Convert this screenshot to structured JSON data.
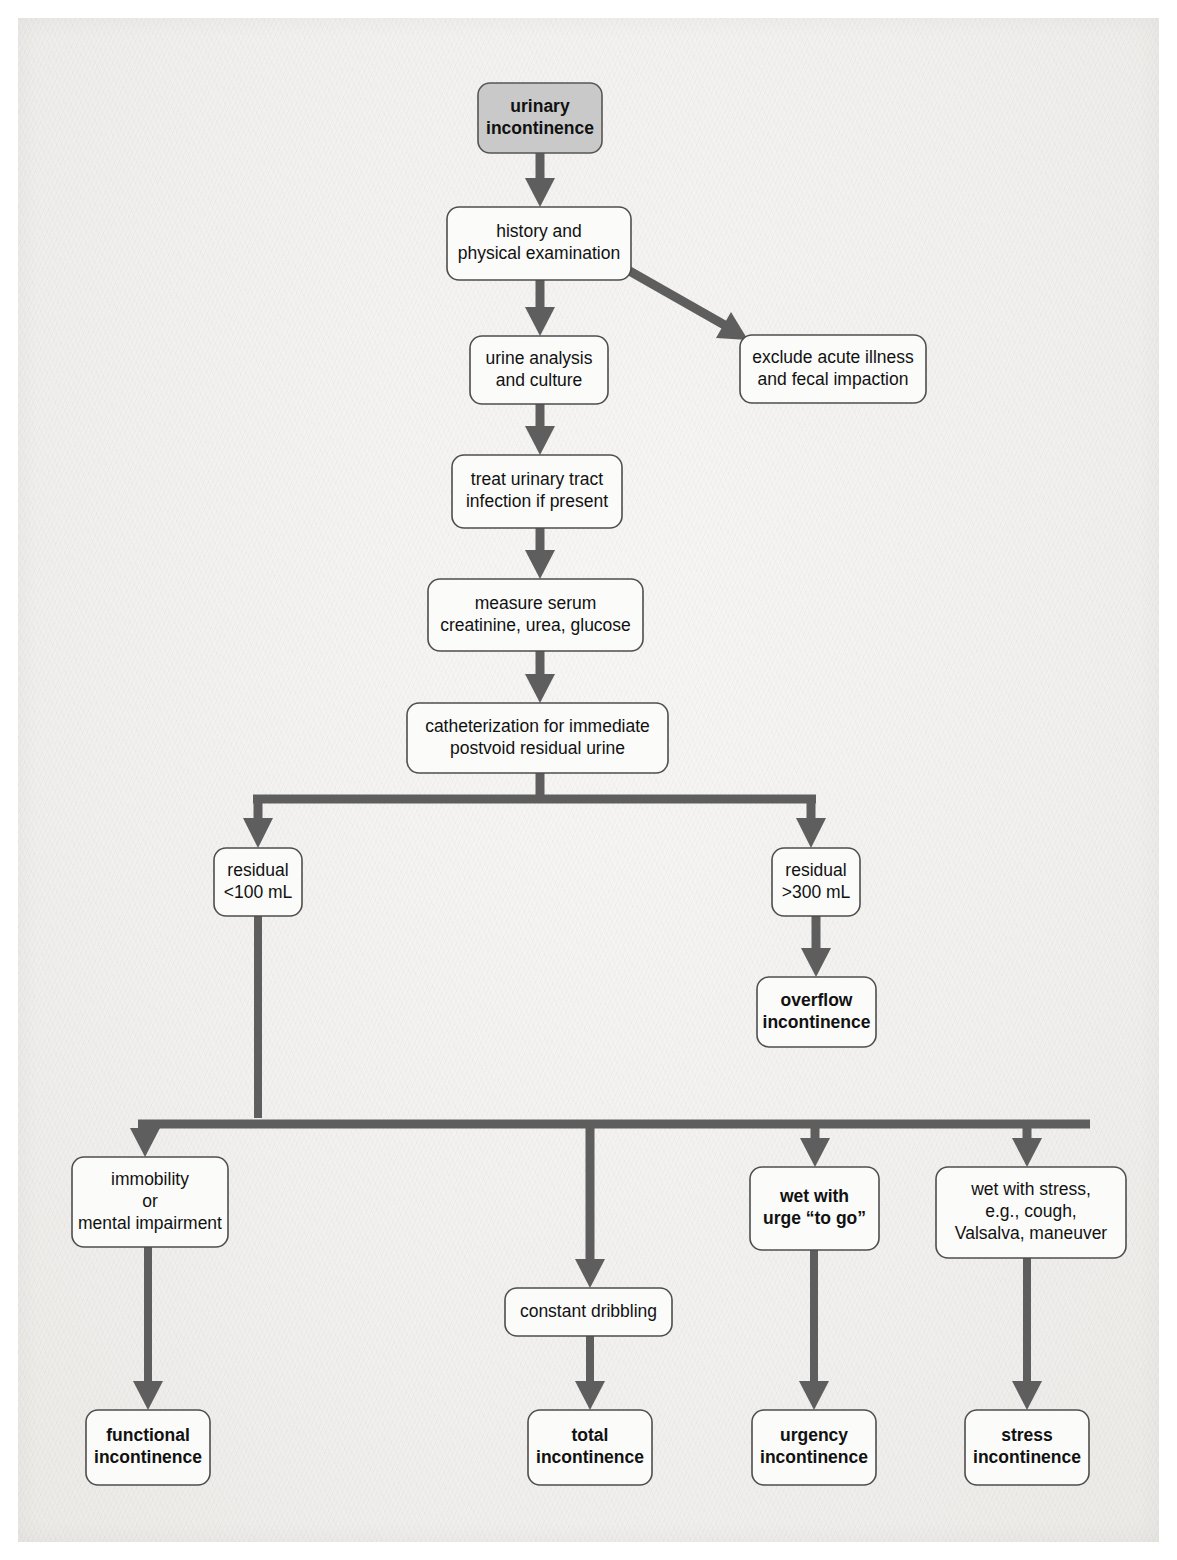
{
  "diagram": {
    "colors": {
      "connector": "#5e5e5e",
      "box_fill": "#fbfbfa",
      "box_stroke": "#4e4e4e",
      "shaded_box_fill": "#c9c9c9",
      "page_background": "#f3f2f0",
      "text": "#111111"
    },
    "nodes": [
      {
        "id": "urinary-incontinence",
        "lines": [
          "urinary",
          "incontinence"
        ],
        "bold": true,
        "shaded": true,
        "x": 478,
        "y": 83,
        "w": 124,
        "h": 70
      },
      {
        "id": "history-and-physical",
        "lines": [
          "history and",
          "physical examination"
        ],
        "bold": false,
        "shaded": false,
        "x": 447,
        "y": 207,
        "w": 184,
        "h": 73
      },
      {
        "id": "exclude-acute-illness",
        "lines": [
          "exclude acute illness",
          "and fecal impaction"
        ],
        "bold": false,
        "shaded": false,
        "x": 740,
        "y": 335,
        "w": 186,
        "h": 68
      },
      {
        "id": "urine-analysis",
        "lines": [
          "urine analysis",
          "and culture"
        ],
        "bold": false,
        "shaded": false,
        "x": 470,
        "y": 336,
        "w": 138,
        "h": 68
      },
      {
        "id": "treat-uti",
        "lines": [
          "treat urinary tract",
          "infection if present"
        ],
        "bold": false,
        "shaded": false,
        "x": 452,
        "y": 455,
        "w": 170,
        "h": 73
      },
      {
        "id": "measure-serum",
        "lines": [
          "measure serum",
          "creatinine, urea, glucose"
        ],
        "bold": false,
        "shaded": false,
        "x": 428,
        "y": 579,
        "w": 215,
        "h": 72
      },
      {
        "id": "catheterization",
        "lines": [
          "catheterization for immediate",
          "postvoid residual urine"
        ],
        "bold": false,
        "shaded": false,
        "x": 407,
        "y": 703,
        "w": 261,
        "h": 70
      },
      {
        "id": "residual-under-100",
        "lines": [
          "residual",
          "<100 mL"
        ],
        "bold": false,
        "shaded": false,
        "x": 214,
        "y": 848,
        "w": 88,
        "h": 68
      },
      {
        "id": "residual-over-300",
        "lines": [
          "residual",
          ">300 mL"
        ],
        "bold": false,
        "shaded": false,
        "x": 772,
        "y": 848,
        "w": 88,
        "h": 68
      },
      {
        "id": "overflow-incontinence",
        "lines": [
          "overflow",
          "incontinence"
        ],
        "bold": true,
        "shaded": false,
        "x": 757,
        "y": 977,
        "w": 119,
        "h": 70
      },
      {
        "id": "immobility-or-mental-impairment",
        "lines": [
          "immobility",
          "or",
          "mental impairment"
        ],
        "bold": false,
        "shaded": false,
        "x": 72,
        "y": 1157,
        "w": 156,
        "h": 90
      },
      {
        "id": "wet-with-urge",
        "lines": [
          "wet with",
          "urge “to go”"
        ],
        "bold": true,
        "shaded": false,
        "x": 750,
        "y": 1167,
        "w": 129,
        "h": 83
      },
      {
        "id": "wet-with-stress",
        "lines": [
          "wet with stress,",
          "e.g., cough,",
          "Valsalva, maneuver"
        ],
        "bold": false,
        "shaded": false,
        "x": 936,
        "y": 1167,
        "w": 190,
        "h": 91
      },
      {
        "id": "constant-dribbling",
        "lines": [
          "constant dribbling"
        ],
        "bold": false,
        "shaded": false,
        "x": 505,
        "y": 1288,
        "w": 167,
        "h": 48
      },
      {
        "id": "functional-incontinence",
        "lines": [
          "functional",
          "incontinence"
        ],
        "bold": true,
        "shaded": false,
        "x": 86,
        "y": 1410,
        "w": 124,
        "h": 75
      },
      {
        "id": "total-incontinence",
        "lines": [
          "total",
          "incontinence"
        ],
        "bold": true,
        "shaded": false,
        "x": 528,
        "y": 1410,
        "w": 124,
        "h": 75
      },
      {
        "id": "urgency-incontinence",
        "lines": [
          "urgency",
          "incontinence"
        ],
        "bold": true,
        "shaded": false,
        "x": 752,
        "y": 1410,
        "w": 124,
        "h": 75
      },
      {
        "id": "stress-incontinence",
        "lines": [
          "stress",
          "incontinence"
        ],
        "bold": true,
        "shaded": false,
        "x": 965,
        "y": 1410,
        "w": 124,
        "h": 75
      }
    ],
    "edges": [
      {
        "id": "ui-to-history",
        "from": "urinary-incontinence",
        "to": "history-and-physical"
      },
      {
        "id": "history-to-exclude",
        "from": "history-and-physical",
        "to": "exclude-acute-illness"
      },
      {
        "id": "history-to-urine",
        "from": "history-and-physical",
        "to": "urine-analysis"
      },
      {
        "id": "urine-to-treat",
        "from": "urine-analysis",
        "to": "treat-uti"
      },
      {
        "id": "treat-to-measure",
        "from": "treat-uti",
        "to": "measure-serum"
      },
      {
        "id": "measure-to-catheterization",
        "from": "measure-serum",
        "to": "catheterization"
      },
      {
        "id": "catheterization-to-residual-under-100",
        "from": "catheterization",
        "to": "residual-under-100"
      },
      {
        "id": "catheterization-to-residual-over-300",
        "from": "catheterization",
        "to": "residual-over-300"
      },
      {
        "id": "residual-over-300-to-overflow",
        "from": "residual-over-300",
        "to": "overflow-incontinence"
      },
      {
        "id": "residual-under-100-to-immobility",
        "from": "residual-under-100",
        "to": "immobility-or-mental-impairment"
      },
      {
        "id": "residual-under-100-to-dribbling",
        "from": "residual-under-100",
        "to": "constant-dribbling"
      },
      {
        "id": "residual-under-100-to-urge",
        "from": "residual-under-100",
        "to": "wet-with-urge"
      },
      {
        "id": "residual-under-100-to-stress",
        "from": "residual-under-100",
        "to": "wet-with-stress"
      },
      {
        "id": "immobility-to-functional",
        "from": "immobility-or-mental-impairment",
        "to": "functional-incontinence"
      },
      {
        "id": "dribbling-to-total",
        "from": "constant-dribbling",
        "to": "total-incontinence"
      },
      {
        "id": "urge-to-urgency",
        "from": "wet-with-urge",
        "to": "urgency-incontinence"
      },
      {
        "id": "stress-to-stress-incontinence",
        "from": "wet-with-stress",
        "to": "stress-incontinence"
      }
    ]
  }
}
